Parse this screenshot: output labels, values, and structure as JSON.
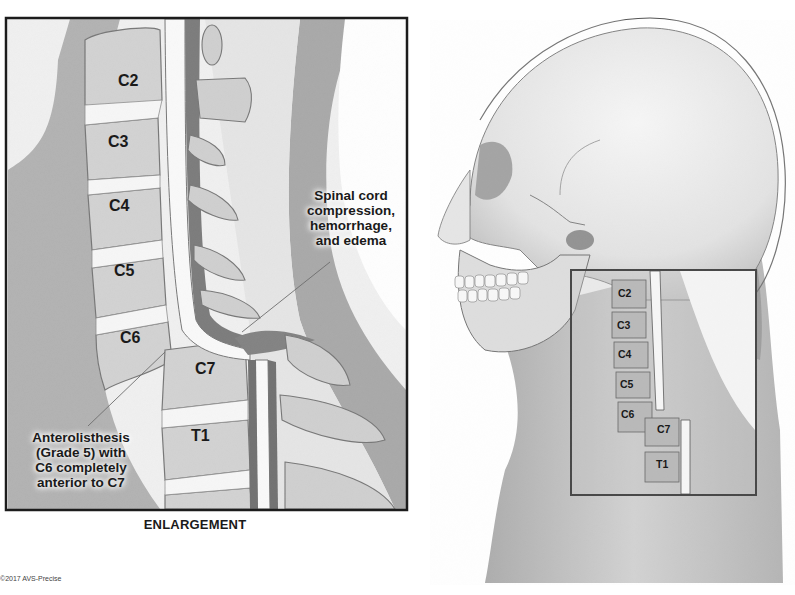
{
  "figure": {
    "enlargement": {
      "caption": "ENLARGEMENT",
      "vertebrae": [
        "C2",
        "C3",
        "C4",
        "C5",
        "C6",
        "C7",
        "T1"
      ],
      "callouts": {
        "cord": {
          "lines": [
            "Spinal cord",
            "compression,",
            "hemorrhage,",
            "and edema"
          ]
        },
        "anterolisthesis": {
          "lines": [
            "Anterolisthesis",
            "(Grade 5) with",
            "C6 completely",
            "anterior to C7"
          ]
        }
      }
    },
    "overview": {
      "vertebrae": [
        "C2",
        "C3",
        "C4",
        "C5",
        "C6",
        "C7",
        "T1"
      ]
    },
    "copyright": "©2017 AVS-Precise",
    "colors": {
      "soft_tissue": "#8a8a8a",
      "bone_light": "#e6e6e6",
      "bone_mid": "#b9b9b9",
      "outline": "#222222",
      "disc": "#f2f2f2"
    }
  }
}
